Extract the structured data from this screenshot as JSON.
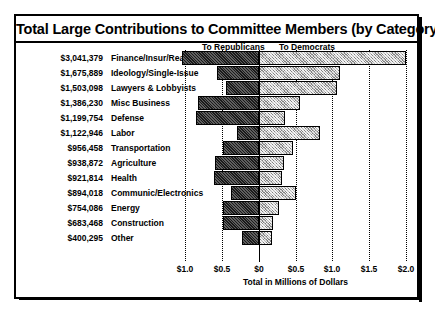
{
  "figure": {
    "title": "Total Large Contributions to Committee Members (by Category)",
    "legend": {
      "republicans_label": "To Republicans",
      "democrats_label": "To Democrats"
    },
    "xaxis_title": "Total in Millions of Dollars",
    "tick_labels": [
      "$1.0",
      "$0.5",
      "$0",
      "$0.5",
      "$1.0",
      "$1.5",
      "$2.0"
    ]
  },
  "chart_data": {
    "type": "bar",
    "orientation": "horizontal",
    "subtype": "diverging-stacked",
    "title": "Total Large Contributions to Committee Members (by Category)",
    "xlabel": "Total in Millions of Dollars",
    "ylabel": "",
    "xlim": [
      -1.0,
      2.0
    ],
    "xticks": [
      -1.0,
      -0.5,
      0.0,
      0.5,
      1.0,
      1.5,
      2.0
    ],
    "xticklabels": [
      "$1.0",
      "$0.5",
      "$0",
      "$0.5",
      "$1.0",
      "$1.5",
      "$2.0"
    ],
    "grid": true,
    "legend_position": "top",
    "series": [
      {
        "name": "To Republicans",
        "direction": "left"
      },
      {
        "name": "To Democrats",
        "direction": "right"
      }
    ],
    "categories": [
      "Finance/Insur/Real Est",
      "Ideology/Single-Issue",
      "Lawyers & Lobbyists",
      "Misc Business",
      "Defense",
      "Labor",
      "Transportation",
      "Agriculture",
      "Health",
      "Communic/Electronics",
      "Energy",
      "Construction",
      "Other"
    ],
    "totals_formatted": [
      "$3,041,379",
      "$1,675,889",
      "$1,503,098",
      "$1,386,230",
      "$1,199,754",
      "$1,122,946",
      "$956,458",
      "$938,872",
      "$921,814",
      "$894,018",
      "$754,086",
      "$683,468",
      "$400,295"
    ],
    "totals": [
      3041379,
      1675889,
      1503098,
      1386230,
      1199754,
      1122946,
      956458,
      938872,
      921814,
      894018,
      754086,
      683468,
      400295
    ],
    "rows": [
      {
        "category": "Finance/Insur/Real Est",
        "total_formatted": "$3,041,379",
        "republicans": 1.04,
        "democrats": 2.0
      },
      {
        "category": "Ideology/Single-Issue",
        "total_formatted": "$1,675,889",
        "republicans": 0.56,
        "democrats": 1.11
      },
      {
        "category": "Lawyers & Lobbyists",
        "total_formatted": "$1,503,098",
        "republicans": 0.44,
        "democrats": 1.06
      },
      {
        "category": "Misc Business",
        "total_formatted": "$1,386,230",
        "republicans": 0.82,
        "democrats": 0.56
      },
      {
        "category": "Defense",
        "total_formatted": "$1,199,754",
        "republicans": 0.85,
        "democrats": 0.36
      },
      {
        "category": "Labor",
        "total_formatted": "$1,122,946",
        "republicans": 0.29,
        "democrats": 0.83
      },
      {
        "category": "Transportation",
        "total_formatted": "$956,458",
        "republicans": 0.49,
        "democrats": 0.47
      },
      {
        "category": "Agriculture",
        "total_formatted": "$938,872",
        "republicans": 0.59,
        "democrats": 0.35
      },
      {
        "category": "Health",
        "total_formatted": "$921,814",
        "republicans": 0.6,
        "democrats": 0.32
      },
      {
        "category": "Communic/Electronics",
        "total_formatted": "$894,018",
        "republicans": 0.38,
        "democrats": 0.51
      },
      {
        "category": "Energy",
        "total_formatted": "$754,086",
        "republicans": 0.48,
        "democrats": 0.27
      },
      {
        "category": "Construction",
        "total_formatted": "$683,468",
        "republicans": 0.49,
        "democrats": 0.2
      },
      {
        "category": "Other",
        "total_formatted": "$400,295",
        "republicans": 0.22,
        "democrats": 0.18
      }
    ]
  }
}
